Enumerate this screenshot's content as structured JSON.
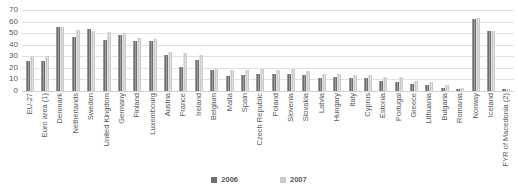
{
  "chart_data": {
    "type": "bar",
    "title": "",
    "subtitle": "",
    "xlabel": "",
    "ylabel": "",
    "ylim": [
      0,
      70
    ],
    "yticks": [
      0,
      10,
      20,
      30,
      40,
      50,
      60,
      70
    ],
    "grid": true,
    "legend_position": "bottom",
    "categories": [
      "EU-27",
      "Euro area (1)",
      "Denmark",
      "Netherlands",
      "Sweden",
      "United Kingdom",
      "Germany",
      "Finland",
      "Luxembourg",
      "Austria",
      "France",
      "Ireland",
      "Belgium",
      "Malta",
      "Spain",
      "Czech Republic",
      "Poland",
      "Slovenia",
      "Slovakia",
      "Latvia",
      "Hungary",
      "Italy",
      "Cyprus",
      "Estonia",
      "Portugal",
      "Greece",
      "Lithuania",
      "Bulgaria",
      "Romania",
      "Norway",
      "Iceland",
      "FYR of Macedonia (2)"
    ],
    "series": [
      {
        "name": "2006",
        "color": "#6f6f71",
        "values": [
          26,
          26,
          55,
          47,
          54,
          44,
          48,
          43,
          43,
          31,
          21,
          27,
          18,
          13,
          14,
          15,
          15,
          15,
          14,
          11,
          12,
          11,
          11,
          9,
          8,
          6,
          5,
          3,
          2,
          62,
          52,
          2
        ]
      },
      {
        "name": "2007",
        "color": "#c9c9cb",
        "values": [
          30,
          30,
          55,
          53,
          52,
          51,
          50,
          46,
          45,
          34,
          33,
          31,
          19,
          18,
          18,
          19,
          18,
          19,
          17,
          15,
          15,
          14,
          14,
          12,
          12,
          9,
          8,
          5,
          3,
          63,
          52,
          2
        ]
      }
    ]
  }
}
